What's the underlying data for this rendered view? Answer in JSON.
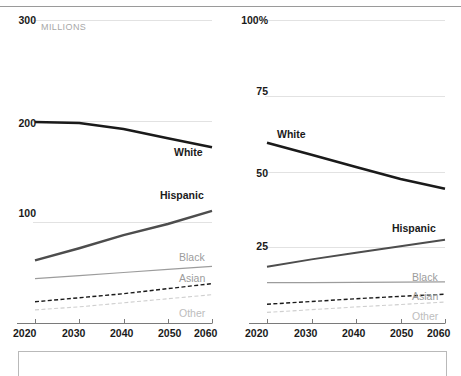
{
  "figure": {
    "top_rule": true,
    "bottom_box": true,
    "background": "#ffffff"
  },
  "colors": {
    "white_line": "#1a1a1a",
    "hispanic_line": "#4d4d4d",
    "black_line": "#9c9c9c",
    "asian_line": "#1a1a1a",
    "other_line": "#cfcfcf",
    "gridline": "#e2e2e2",
    "axis": "#7a7a7a",
    "tick_text": "#1a1a1a",
    "muted_text": "#a8a8a8"
  },
  "chart_data": [
    {
      "type": "line",
      "title": "",
      "xlabel": "",
      "ylabel": "MILLIONS",
      "unit_note": "MILLIONS",
      "x": [
        2020,
        2030,
        2040,
        2050,
        2060
      ],
      "xtick_labels": [
        "2020",
        "2030",
        "2040",
        "2050",
        "2060"
      ],
      "xlim": [
        2020,
        2060
      ],
      "ytick_labels": [
        "300",
        "200",
        "100"
      ],
      "ytick_values": [
        300,
        200,
        100
      ],
      "ylim": [
        0,
        300
      ],
      "grid": true,
      "legend": "inline-labels",
      "series": [
        {
          "name": "White",
          "label": "White",
          "style": "solid",
          "width": 2.6,
          "color": "#1a1a1a",
          "values": [
            199,
            198,
            192,
            183,
            174
          ]
        },
        {
          "name": "Hispanic",
          "label": "Hispanic",
          "style": "solid",
          "width": 2.4,
          "color": "#4d4d4d",
          "values": [
            62,
            74,
            87,
            98,
            111
          ]
        },
        {
          "name": "Black",
          "label": "Black",
          "style": "solid",
          "width": 1.2,
          "color": "#9c9c9c",
          "values": [
            44,
            47,
            50,
            53,
            56
          ]
        },
        {
          "name": "Asian",
          "label": "Asian",
          "style": "dashed",
          "width": 1.4,
          "color": "#1a1a1a",
          "values": [
            21,
            25,
            29,
            34,
            39
          ]
        },
        {
          "name": "Other",
          "label": "Other",
          "style": "dashed",
          "width": 1.1,
          "color": "#cfcfcf",
          "values": [
            13,
            16,
            20,
            24,
            28
          ]
        }
      ]
    },
    {
      "type": "line",
      "title": "",
      "xlabel": "",
      "ylabel": "",
      "unit_note": "",
      "x": [
        2020,
        2030,
        2040,
        2050,
        2060
      ],
      "xtick_labels": [
        "2020",
        "2030",
        "2040",
        "2050",
        "2060"
      ],
      "xlim": [
        2020,
        2060
      ],
      "ytick_labels": [
        "100%",
        "75",
        "50",
        "25"
      ],
      "ytick_values": [
        100,
        75,
        50,
        25
      ],
      "ylim": [
        0,
        100
      ],
      "grid": true,
      "legend": "inline-labels",
      "series": [
        {
          "name": "White",
          "label": "White",
          "style": "solid",
          "width": 2.6,
          "color": "#1a1a1a",
          "values": [
            59.5,
            55.5,
            51.5,
            47.5,
            44.3
          ]
        },
        {
          "name": "Hispanic",
          "label": "Hispanic",
          "style": "solid",
          "width": 2.0,
          "color": "#4d4d4d",
          "values": [
            18.6,
            21.0,
            23.2,
            25.3,
            27.5
          ]
        },
        {
          "name": "Black",
          "label": "Black",
          "style": "solid",
          "width": 1.2,
          "color": "#9c9c9c",
          "values": [
            13.3,
            13.3,
            13.4,
            13.5,
            13.6
          ]
        },
        {
          "name": "Asian",
          "label": "Asian",
          "style": "dashed",
          "width": 1.4,
          "color": "#1a1a1a",
          "values": [
            6.2,
            7.1,
            8.0,
            8.8,
            9.5
          ]
        },
        {
          "name": "Other",
          "label": "Other",
          "style": "dashed",
          "width": 1.1,
          "color": "#cfcfcf",
          "values": [
            3.5,
            4.4,
            5.3,
            6.1,
            6.9
          ]
        }
      ]
    }
  ],
  "left_chart": {
    "y_ticks": [
      {
        "label": "300",
        "y": 20
      },
      {
        "label": "200",
        "y": 123
      },
      {
        "label": "100",
        "y": 213
      }
    ],
    "unit": "MILLIONS",
    "x_ticks": [
      "2020",
      "2030",
      "2040",
      "2050",
      "2060"
    ],
    "series_labels": [
      {
        "text": "White",
        "style": "bold"
      },
      {
        "text": "Hispanic",
        "style": "bold"
      },
      {
        "text": "Black",
        "style": "gray"
      },
      {
        "text": "Asian",
        "style": "gray"
      },
      {
        "text": "Other",
        "style": "ltgray"
      }
    ]
  },
  "right_chart": {
    "y_ticks": [
      {
        "label": "100%",
        "y": 20
      },
      {
        "label": "75",
        "y": 91
      },
      {
        "label": "50",
        "y": 173
      },
      {
        "label": "25",
        "y": 246
      }
    ],
    "unit": "",
    "x_ticks": [
      "2020",
      "2030",
      "2040",
      "2050",
      "2060"
    ],
    "series_labels": [
      {
        "text": "White",
        "style": "bold"
      },
      {
        "text": "Hispanic",
        "style": "bold"
      },
      {
        "text": "Black",
        "style": "gray"
      },
      {
        "text": "Asian",
        "style": "gray"
      },
      {
        "text": "Other",
        "style": "ltgray"
      }
    ]
  }
}
